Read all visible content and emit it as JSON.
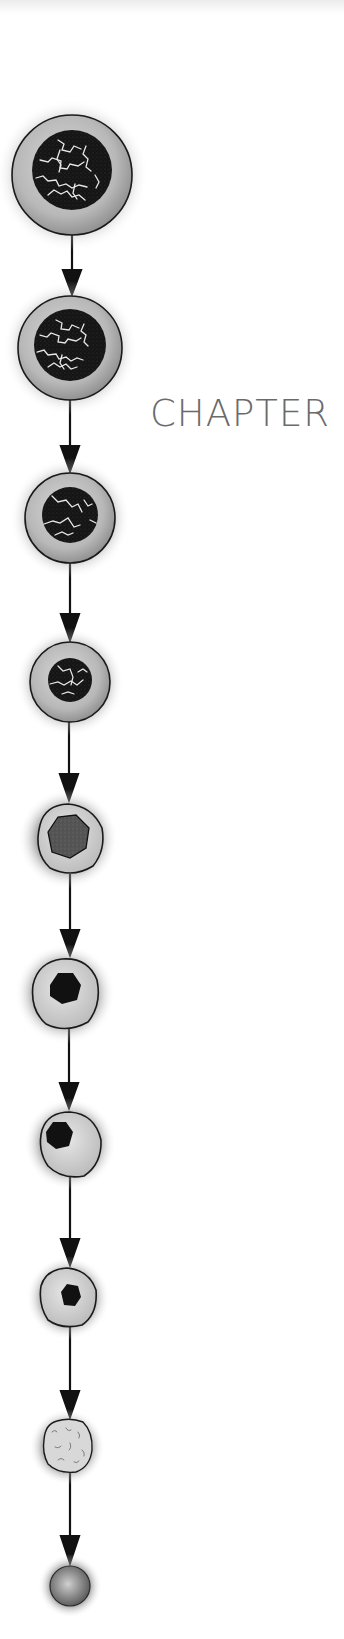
{
  "page": {
    "heading": "CHAPTER",
    "colors": {
      "text": "#6a6a6a",
      "outline": "#1a1a1a",
      "cytoplasm": "#bdbdbd",
      "nucleus_dark": "#151515",
      "nucleus_mid": "#555555"
    }
  },
  "diagram": {
    "type": "vertical cell progression",
    "cells": [
      {
        "id": 1,
        "cx": 72,
        "cy": 175,
        "r": 60,
        "nucleus": "large-chromatin",
        "nr": 40
      },
      {
        "id": 2,
        "cx": 70,
        "cy": 348,
        "r": 52,
        "nucleus": "large-chromatin",
        "nr": 36
      },
      {
        "id": 3,
        "cx": 70,
        "cy": 518,
        "r": 45,
        "nucleus": "condensing-chromatin",
        "nr": 28
      },
      {
        "id": 4,
        "cx": 70,
        "cy": 682,
        "r": 40,
        "nucleus": "condensing-chromatin",
        "nr": 22
      },
      {
        "id": 5,
        "cx": 68,
        "cy": 839,
        "r": 35,
        "nucleus": "gray-solid",
        "nr": 21
      },
      {
        "id": 6,
        "cx": 65,
        "cy": 994,
        "r": 35,
        "nucleus": "dark-solid",
        "nr": 16
      },
      {
        "id": 7,
        "cx": 70,
        "cy": 1144,
        "r": 32,
        "nucleus": "dark-solid-eccentric",
        "nr": 13
      },
      {
        "id": 8,
        "cx": 68,
        "cy": 1298,
        "r": 29,
        "nucleus": "dark-solid",
        "nr": 11
      },
      {
        "id": 9,
        "cx": 67,
        "cy": 1447,
        "r": 25,
        "nucleus": "reticulum",
        "nr": 0
      },
      {
        "id": 10,
        "cx": 70,
        "cy": 1586,
        "r": 20,
        "nucleus": "none",
        "nr": 0
      }
    ],
    "arrow_x": 71
  }
}
